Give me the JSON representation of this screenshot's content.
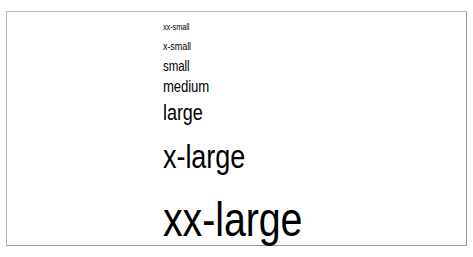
{
  "figure": {
    "background_color": "#ffffff",
    "border_color": "#b9b9b9",
    "text_color": "#000000",
    "samples": [
      {
        "keyword": "xx-small"
      },
      {
        "keyword": "x-small"
      },
      {
        "keyword": "small"
      },
      {
        "keyword": "medium"
      },
      {
        "keyword": "large"
      },
      {
        "keyword": "x-large"
      },
      {
        "keyword": "xx-large"
      }
    ]
  }
}
